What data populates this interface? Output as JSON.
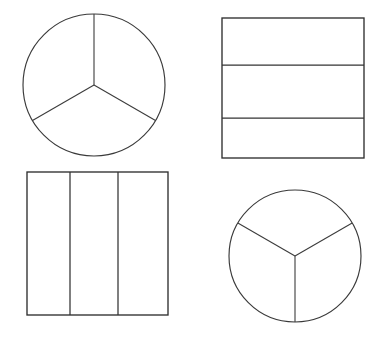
{
  "figure": {
    "background_color": "#ffffff",
    "stroke_color": "#3a3a3a",
    "fill_color": "#ffffff",
    "width": 381,
    "height": 339,
    "shape_count": 4,
    "parts_per_shape": 3,
    "shapes": [
      {
        "id": "top-left-circle",
        "name": "circle-three-sectors-upright",
        "kind": "circle",
        "position": "top-left",
        "parts": 3,
        "equal_parts": true,
        "center_x": 94,
        "center_y": 85,
        "radius": 71,
        "radii_angles_deg": [
          90,
          210,
          330
        ],
        "description": "Circle cut into three equal sectors by radii pointing up, lower-left and lower-right"
      },
      {
        "id": "top-right-rectangle",
        "name": "rectangle-three-horizontal-bands",
        "kind": "rectangle",
        "position": "top-right",
        "parts": 3,
        "equal_parts": false,
        "x": 222,
        "y": 18,
        "width": 142,
        "height": 140,
        "divider_orientation": "horizontal",
        "divider_positions_y": [
          65,
          118
        ],
        "description": "Rectangle cut into three horizontal bands by two horizontal lines"
      },
      {
        "id": "bottom-left-square",
        "name": "square-three-vertical-columns",
        "kind": "square",
        "position": "bottom-left",
        "parts": 3,
        "equal_parts": false,
        "x": 27,
        "y": 172,
        "width": 141,
        "height": 143,
        "divider_orientation": "vertical",
        "divider_positions_x": [
          70,
          118
        ],
        "description": "Square cut into three vertical columns by two vertical lines"
      },
      {
        "id": "bottom-right-circle",
        "name": "circle-three-sectors-inverted",
        "kind": "circle",
        "position": "bottom-right",
        "parts": 3,
        "equal_parts": true,
        "center_x": 295,
        "center_y": 256,
        "radius": 66,
        "radii_angles_deg": [
          270,
          30,
          150
        ],
        "description": "Circle cut into three equal sectors by radii pointing down, upper-right and upper-left"
      }
    ]
  }
}
